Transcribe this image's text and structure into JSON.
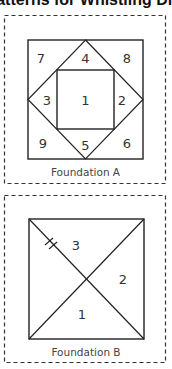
{
  "title": "Patterns for Whistling Dixie",
  "foundation_a": {
    "label": "Foundation A",
    "pieces": {
      "p1": "1",
      "p2": "2",
      "p3": "3",
      "p4": "4",
      "p5": "5",
      "p6": "6",
      "p7": "7",
      "p8": "8",
      "p9": "9"
    }
  },
  "foundation_b": {
    "label": "Foundation B",
    "pieces": {
      "p1": "1",
      "p2": "2",
      "p3": "3"
    },
    "marks": "grain-line-hash"
  },
  "colors": {
    "line": "#222222",
    "dash": "#333333",
    "text": "#444444"
  }
}
